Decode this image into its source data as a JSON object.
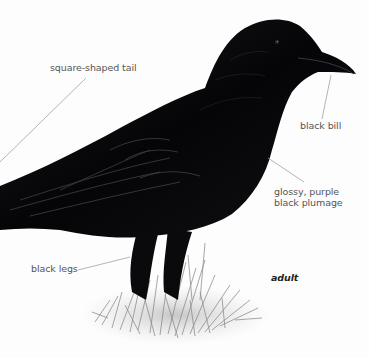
{
  "illustration": {
    "subject": "crow",
    "stage_label": "adult",
    "colors": {
      "background": "#fdfdfd",
      "plumage": "#0c0c10",
      "plumage_sheen": "#3a3a48",
      "leader_line": "#9a9a9a",
      "label_text": "#555555",
      "grass": "#8a8a8a"
    }
  },
  "annotations": [
    {
      "id": "tail",
      "text": "square-shaped tail"
    },
    {
      "id": "bill",
      "text": "black bill"
    },
    {
      "id": "plumage",
      "lines": [
        "glossy, purple",
        "black plumage"
      ]
    },
    {
      "id": "legs",
      "text": "black legs"
    }
  ]
}
